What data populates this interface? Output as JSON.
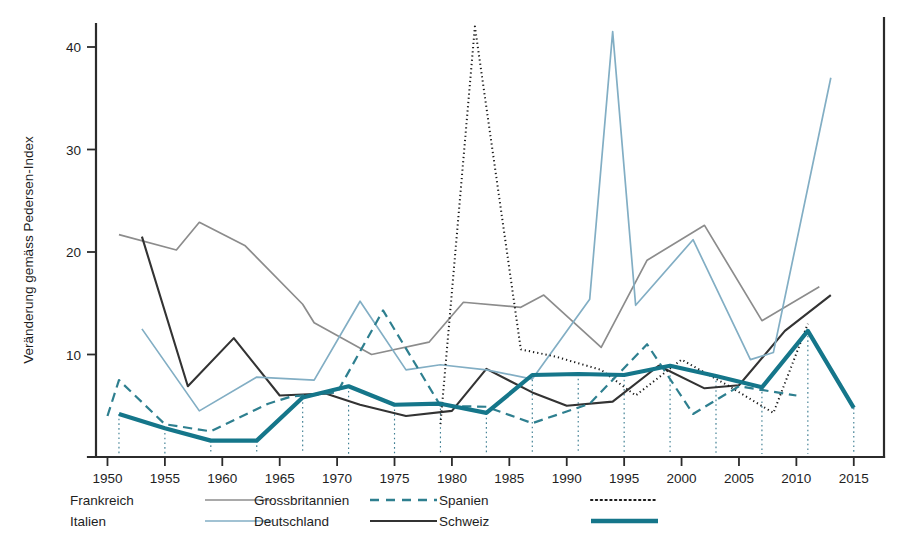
{
  "chart_data": {
    "type": "line",
    "title": "",
    "subtitle": "",
    "xlabel": "",
    "ylabel": "Veränderung gemäss Pedersen-Index",
    "xlim": [
      1949.0,
      2016.5
    ],
    "ylim": [
      0,
      43.5
    ],
    "grid": false,
    "legend_position": "below-axis",
    "x_ticks": [
      1950,
      1955,
      1960,
      1965,
      1970,
      1975,
      1980,
      1985,
      1990,
      1995,
      2000,
      2005,
      2010,
      2015
    ],
    "x_tick_labels": [
      "1950",
      "1955",
      "1960",
      "1965",
      "1970",
      "1975",
      "1980",
      "1985",
      "1990",
      "1995",
      "2000",
      "2005",
      "2010",
      "2015"
    ],
    "y_ticks": [
      10,
      20,
      30,
      40
    ],
    "y_tick_labels": [
      "10",
      "20",
      "30",
      "40"
    ],
    "annotations": {
      "election_markers_label": "Schweizer Wahljahre",
      "election_marker_years": [
        1951,
        1955,
        1959,
        1963,
        1967,
        1971,
        1975,
        1979,
        1983,
        1987,
        1991,
        1995,
        1999,
        2003,
        2007,
        2011,
        2015
      ]
    },
    "series": [
      {
        "name": "Frankreich",
        "color": "#8c8c8c",
        "style": "solid",
        "width": 1.7,
        "x": [
          1951,
          1956,
          1958,
          1962,
          1967,
          1968,
          1973,
          1978,
          1981,
          1986,
          1988,
          1993,
          1997,
          2002,
          2007,
          2012
        ],
        "y": [
          21.7,
          20.2,
          22.9,
          20.6,
          14.9,
          13.1,
          10.0,
          11.2,
          15.1,
          14.6,
          15.8,
          10.7,
          19.2,
          22.6,
          13.3,
          16.6
        ]
      },
      {
        "name": "Deutschland",
        "color": "#333333",
        "style": "solid",
        "width": 2.1,
        "x": [
          1953,
          1957,
          1961,
          1965,
          1969,
          1972,
          1976,
          1980,
          1983,
          1987,
          1990,
          1994,
          1998,
          2002,
          2005,
          2009,
          2013
        ],
        "y": [
          21.5,
          6.9,
          11.6,
          6.0,
          6.2,
          5.1,
          4.0,
          4.5,
          8.6,
          6.3,
          5.0,
          5.4,
          8.9,
          6.7,
          7.0,
          12.3,
          15.8
        ]
      },
      {
        "name": "Italien",
        "color": "#82aec4",
        "style": "solid",
        "width": 1.7,
        "x": [
          1953,
          1958,
          1963,
          1968,
          1972,
          1976,
          1979,
          1983,
          1987,
          1992,
          1994,
          1996,
          2001,
          2006,
          2008,
          2013
        ],
        "y": [
          12.5,
          4.5,
          7.8,
          7.5,
          15.2,
          8.5,
          9.0,
          8.5,
          7.6,
          15.4,
          41.5,
          14.8,
          21.2,
          9.5,
          10.2,
          37.0
        ]
      },
      {
        "name": "Spanien",
        "color": "#1a1a1a",
        "style": "dotted",
        "width": 2.0,
        "x": [
          1979,
          1982,
          1986,
          1989,
          1993,
          1996,
          2000,
          2004,
          2008,
          2011
        ],
        "y": [
          3.2,
          42.0,
          10.5,
          9.8,
          8.5,
          6.0,
          9.5,
          7.0,
          4.3,
          13.0
        ]
      },
      {
        "name": "Grossbritannien",
        "color": "#2e7f8f",
        "style": "dashed",
        "width": 2.2,
        "x": [
          1950,
          1951,
          1955,
          1959,
          1964,
          1966,
          1970,
          1974,
          1979,
          1983,
          1987,
          1992,
          1997,
          2001,
          2005,
          2010
        ],
        "y": [
          4.0,
          7.5,
          3.2,
          2.5,
          5.2,
          5.9,
          6.3,
          14.3,
          5.0,
          4.9,
          3.3,
          5.2,
          11.0,
          4.2,
          6.9,
          6.0
        ]
      },
      {
        "name": "Schweiz",
        "color": "#15768a",
        "style": "solid",
        "width": 4.2,
        "x": [
          1951,
          1955,
          1959,
          1963,
          1967,
          1971,
          1975,
          1979,
          1983,
          1987,
          1991,
          1995,
          1999,
          2003,
          2007,
          2011,
          2015
        ],
        "y": [
          4.2,
          2.8,
          1.6,
          1.6,
          5.8,
          6.9,
          5.1,
          5.2,
          4.3,
          8.0,
          8.1,
          8.0,
          8.9,
          7.9,
          6.8,
          12.3,
          4.8
        ]
      }
    ]
  },
  "axes": {
    "y_label": "Veränderung gemäss Pedersen-Index"
  },
  "legend": {
    "entries": [
      {
        "label": "Frankreich",
        "color": "#8c8c8c",
        "style": "solid",
        "width": 1.7
      },
      {
        "label": "Italien",
        "color": "#82aec4",
        "style": "solid",
        "width": 1.7
      },
      {
        "label": "Grossbritannien",
        "color": "#2e7f8f",
        "style": "dashed",
        "width": 2.4
      },
      {
        "label": "Deutschland",
        "color": "#333333",
        "style": "solid",
        "width": 2.2
      },
      {
        "label": "Spanien",
        "color": "#1a1a1a",
        "style": "dotted",
        "width": 2.0
      },
      {
        "label": "Schweiz",
        "color": "#15768a",
        "style": "solid",
        "width": 4.6
      }
    ]
  }
}
